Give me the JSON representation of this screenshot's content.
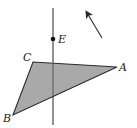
{
  "diagram": {
    "type": "geometry",
    "colors": {
      "stroke": "#2a2a2a",
      "fill": "#a9a9a9",
      "background": "#ffffff"
    },
    "triangle": {
      "vertices": {
        "A": {
          "label": "A",
          "x": 117,
          "y": 67
        },
        "B": {
          "label": "B",
          "x": 13,
          "y": 115
        },
        "C": {
          "label": "C",
          "x": 33,
          "y": 62
        }
      }
    },
    "line": {
      "x1": 53,
      "y1": 8,
      "x2": 53,
      "y2": 125
    },
    "point_E": {
      "label": "E",
      "x": 53,
      "y": 39
    },
    "arrow": {
      "x1": 102,
      "y1": 38,
      "x2": 86,
      "y2": 11
    },
    "labels": {
      "A": "A",
      "B": "B",
      "C": "C",
      "E": "E"
    }
  }
}
